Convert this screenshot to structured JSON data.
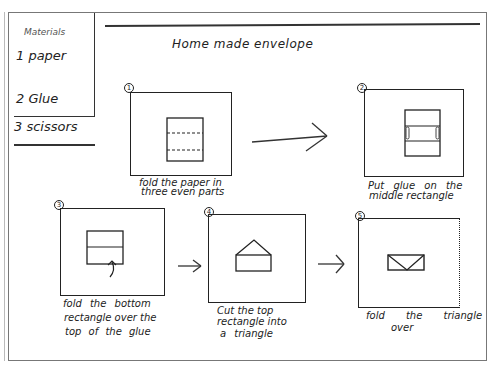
{
  "title": "Home made envelope",
  "materials": {
    "heading": "Materials",
    "items": [
      {
        "label": "1 paper"
      },
      {
        "label": "2 Glue"
      },
      {
        "label": "3 scissors"
      }
    ]
  },
  "steps": [
    {
      "number": "1",
      "caption_lines": [
        "fold the paper in",
        "three even parts"
      ],
      "illustration": "paper-folded-in-thirds"
    },
    {
      "number": "2",
      "caption_lines": [
        "Put glue on the",
        "middle rectangle"
      ],
      "illustration": "glue-on-middle-rectangle"
    },
    {
      "number": "3",
      "caption_lines": [
        "fold the bottom",
        "rectangle over the",
        "top of the glue"
      ],
      "illustration": "fold-bottom-up"
    },
    {
      "number": "4",
      "caption_lines": [
        "Cut the top",
        "rectangle into",
        "a triangle"
      ],
      "illustration": "triangle-flap"
    },
    {
      "number": "5",
      "caption_lines": [
        "fold the triangle",
        "over"
      ],
      "illustration": "closed-envelope"
    }
  ],
  "arrows": [
    {
      "from": "1",
      "to": "2"
    },
    {
      "from": "3",
      "to": "4"
    },
    {
      "from": "4",
      "to": "5"
    }
  ],
  "colors": {
    "ink": "#1c1c1c",
    "paper": "#ffffff",
    "frame": "#777777"
  }
}
